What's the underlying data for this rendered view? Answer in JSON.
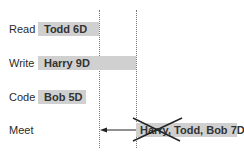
{
  "diagram": {
    "type": "task-schedule",
    "rows": [
      {
        "label": "Read",
        "bar_text": "Todd 6D"
      },
      {
        "label": "Write",
        "bar_text": "Harry 9D"
      },
      {
        "label": "Code",
        "bar_text": "Bob 5D"
      },
      {
        "label": "Meet",
        "bar_text": "Harry, Todd, Bob 7D",
        "crossed_out": "Harry"
      }
    ],
    "markers": [
      "dotted-line-1",
      "dotted-line-2"
    ],
    "arrow": {
      "row": "Meet",
      "direction": "left",
      "from": "dotted-line-2",
      "to": "dotted-line-1"
    },
    "colors": {
      "bar": "#d0d0d0",
      "text": "#2a2a2a",
      "line": "#777777",
      "cross": "#222222"
    }
  }
}
